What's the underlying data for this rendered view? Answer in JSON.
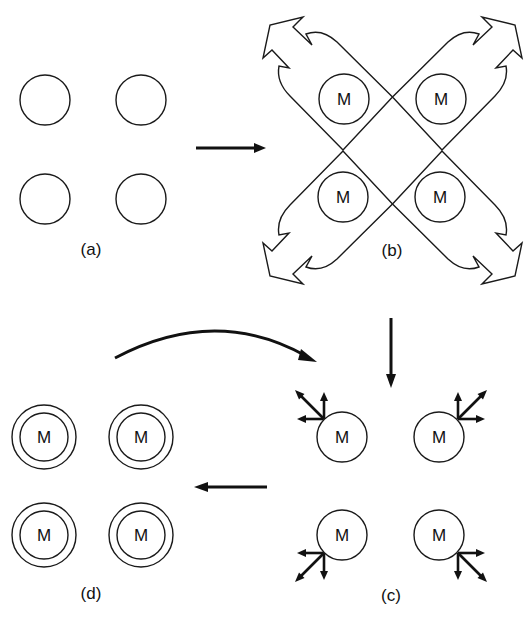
{
  "diagram": {
    "panels": [
      {
        "id": "a",
        "label": "(a)",
        "cells": [
          {
            "text": ""
          },
          {
            "text": ""
          },
          {
            "text": ""
          },
          {
            "text": ""
          }
        ]
      },
      {
        "id": "b",
        "label": "(b)",
        "cells": [
          {
            "text": "M"
          },
          {
            "text": "M"
          },
          {
            "text": "M"
          },
          {
            "text": "M"
          }
        ]
      },
      {
        "id": "c",
        "label": "(c)",
        "cells": [
          {
            "text": "M"
          },
          {
            "text": "M"
          },
          {
            "text": "M"
          },
          {
            "text": "M"
          }
        ]
      },
      {
        "id": "d",
        "label": "(d)",
        "cells": [
          {
            "text": "M"
          },
          {
            "text": "M"
          },
          {
            "text": "M"
          },
          {
            "text": "M"
          }
        ]
      }
    ],
    "transitions": [
      {
        "from": "a",
        "to": "b",
        "style": "straight-arrow-right"
      },
      {
        "from": "b",
        "to": "c",
        "style": "straight-arrow-down"
      },
      {
        "from": "c",
        "to": "d",
        "style": "straight-arrow-left"
      },
      {
        "from": "d",
        "to": "c",
        "style": "curved-arrow-right"
      }
    ],
    "colors": {
      "ink": "#1a1a1a",
      "background": "#ffffff"
    }
  }
}
